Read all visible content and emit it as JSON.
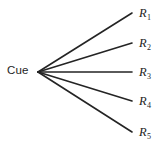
{
  "figure": {
    "type": "fan-diagram",
    "background_color": "#ffffff",
    "line_color": "#242424",
    "text_color": "#1d1d1d",
    "width": 164,
    "height": 147
  },
  "source_node": {
    "label": "Cue",
    "x": 38,
    "y": 72
  },
  "branches": [
    {
      "id": "r1",
      "letter": "R",
      "subscript": "1",
      "label": "R1",
      "line": {
        "x1": 38,
        "y1": 72,
        "x2": 132,
        "y2": 13
      },
      "label_x": 139,
      "label_y": 7
    },
    {
      "id": "r2",
      "letter": "R",
      "subscript": "2",
      "label": "R2",
      "line": {
        "x1": 38,
        "y1": 72,
        "x2": 132,
        "y2": 43
      },
      "label_x": 139,
      "label_y": 37
    },
    {
      "id": "r3",
      "letter": "R",
      "subscript": "3",
      "label": "R3",
      "line": {
        "x1": 38,
        "y1": 72,
        "x2": 132,
        "y2": 72
      },
      "label_x": 139,
      "label_y": 66
    },
    {
      "id": "r4",
      "letter": "R",
      "subscript": "4",
      "label": "R4",
      "line": {
        "x1": 38,
        "y1": 72,
        "x2": 132,
        "y2": 101
      },
      "label_x": 139,
      "label_y": 95
    },
    {
      "id": "r5",
      "letter": "R",
      "subscript": "5",
      "label": "R5",
      "line": {
        "x1": 38,
        "y1": 72,
        "x2": 132,
        "y2": 132
      },
      "label_x": 139,
      "label_y": 126
    }
  ]
}
